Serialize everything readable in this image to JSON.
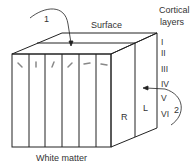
{
  "diagram": {
    "labels": {
      "surface": "Surface",
      "white_matter": "White matter",
      "cortical_layers_line1": "Cortical",
      "cortical_layers_line2": "layers",
      "arrow1": "1",
      "arrow2": "2",
      "side_right": "R",
      "side_left": "L"
    },
    "layers": [
      "I",
      "II",
      "III",
      "IV",
      "V",
      "VI"
    ],
    "columns_count": 6,
    "colors": {
      "stroke": "#222222",
      "text": "#333333",
      "tick": "#888888",
      "background": "#ffffff"
    }
  }
}
